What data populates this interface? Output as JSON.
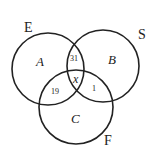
{
  "diagram": {
    "type": "venn",
    "sets": [
      {
        "label": "E",
        "region_label": "A"
      },
      {
        "label": "S",
        "region_label": "B"
      },
      {
        "label": "F",
        "region_label": "C"
      }
    ],
    "intersections": {
      "E_S_only": "31",
      "E_F_only": "19",
      "S_F_only": "1",
      "all_three": "x"
    },
    "stroke_color": "#222222"
  }
}
